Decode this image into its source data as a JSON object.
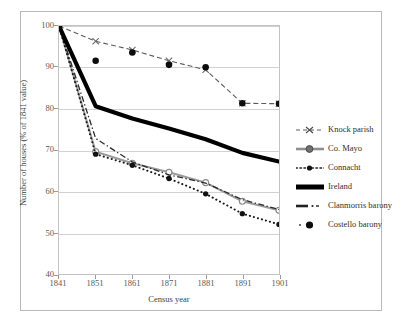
{
  "chart_data": {
    "type": "line",
    "title": "",
    "xlabel": "Census year",
    "ylabel": "Number of houses (% of 1841 value)",
    "x": [
      1841,
      1851,
      1861,
      1871,
      1881,
      1891,
      1901
    ],
    "xticklabels": [
      "1841",
      "1851",
      "1861",
      "1871",
      "1881",
      "1891",
      "1901"
    ],
    "yticklabels": [
      "40",
      "50",
      "60",
      "70",
      "80",
      "90",
      "100"
    ],
    "ylim": [
      40,
      100
    ],
    "xlim": [
      1841,
      1901
    ],
    "grid": "horizontal",
    "legend_position": "right",
    "series": [
      {
        "name": "Knock parish",
        "marker": "x",
        "line": "dashed",
        "color": "#5a5a5a",
        "values": [
          100,
          96.3,
          94.2,
          91.6,
          89.4,
          81.3,
          81.2
        ]
      },
      {
        "name": "Co. Mayo",
        "marker": "circle-open",
        "line": "solid",
        "color": "#9a9a9a",
        "values": [
          100,
          69.6,
          66.8,
          64.6,
          62.1,
          57.6,
          55.4
        ]
      },
      {
        "name": "Connacht",
        "marker": "dot",
        "line": "dotted",
        "color": "#1c1c1c",
        "values": [
          100,
          69.0,
          66.3,
          63.1,
          59.4,
          54.6,
          52.0
        ]
      },
      {
        "name": "Ireland",
        "marker": "none",
        "line": "solid-thick",
        "color": "#000000",
        "values": [
          100,
          80.6,
          77.6,
          75.2,
          72.6,
          69.3,
          67.2
        ]
      },
      {
        "name": "Clanmorris barony",
        "marker": "none",
        "line": "dash-dot",
        "color": "#2a2a2a",
        "values": [
          100,
          72.8,
          67.1,
          64.0,
          62.0,
          58.0,
          55.6
        ]
      },
      {
        "name": "Costello barony",
        "marker": "filled-circle",
        "line": "none",
        "color": "#0d0d0d",
        "values": [
          100,
          91.6,
          93.6,
          90.6,
          90.0,
          81.3,
          81.2
        ]
      }
    ]
  },
  "axes": {
    "y_title": "Number of houses (% of 1841 value)",
    "x_title": "Census year",
    "y_ticks": [
      "100",
      "90",
      "80",
      "70",
      "60",
      "50",
      "40"
    ],
    "x_ticks": [
      "1841",
      "1851",
      "1861",
      "1871",
      "1881",
      "1891",
      "1901"
    ]
  },
  "legend": {
    "items": [
      {
        "label": "Knock parish",
        "icon": "dashed-x-marker-key"
      },
      {
        "label": "Co. Mayo",
        "icon": "solid-circle-marker-key"
      },
      {
        "label": "Connacht",
        "icon": "dotted-dot-marker-key"
      },
      {
        "label": "Ireland",
        "icon": "thick-solid-line-key"
      },
      {
        "label": "Clanmorris barony",
        "icon": "dash-dot-line-key"
      },
      {
        "label": "Costello barony",
        "icon": "filled-circle-marker-key"
      }
    ]
  }
}
